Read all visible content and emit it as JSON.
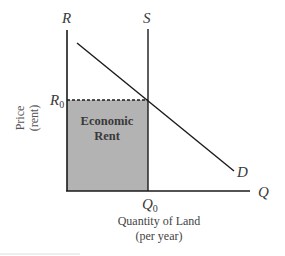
{
  "diagram": {
    "axes": {
      "y_label_line1": "Price",
      "y_label_line2": "(rent)",
      "y_axis_letter": "R",
      "x_label_line1": "Quantity of Land",
      "x_label_line2": "(per year)",
      "x_axis_letter": "Q"
    },
    "curves": {
      "supply_label": "S",
      "demand_label": "D"
    },
    "ticks": {
      "price_main": "R",
      "price_sub": "0",
      "quantity_main": "Q",
      "quantity_sub": "0"
    },
    "region": {
      "label_line1": "Economic",
      "label_line2": "Rent",
      "fill_color": "#b3b3b3"
    },
    "colors": {
      "line": "#1a1a1a",
      "text": "#3a3a3a",
      "axis_label_text": "#555555"
    }
  }
}
